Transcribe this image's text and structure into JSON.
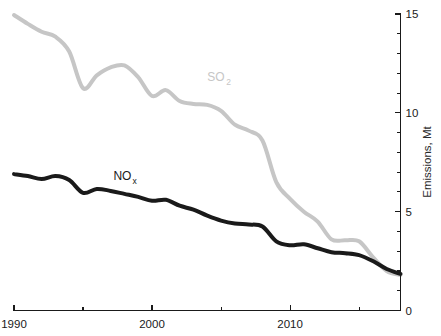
{
  "chart_data": {
    "type": "line",
    "title": "",
    "xlabel": "",
    "ylabel": "Emissions, Mt",
    "xlim": [
      1990,
      2018
    ],
    "ylim": [
      0,
      15
    ],
    "grid": false,
    "legend_position": "inline-annotation",
    "y_axis_side": "right",
    "x_ticks": [
      1990,
      1995,
      2000,
      2005,
      2010,
      2015
    ],
    "x_tick_labels": [
      "1990",
      "",
      "2000",
      "",
      "2010",
      ""
    ],
    "y_ticks": [
      0,
      1,
      2,
      3,
      4,
      5,
      6,
      7,
      8,
      9,
      10,
      11,
      12,
      13,
      14,
      15
    ],
    "y_tick_labels": [
      "0",
      "",
      "",
      "",
      "",
      "5",
      "",
      "",
      "",
      "",
      "10",
      "",
      "",
      "",
      "",
      "15"
    ],
    "x": [
      1990,
      1991,
      1992,
      1993,
      1994,
      1995,
      1996,
      1997,
      1998,
      1999,
      2000,
      2001,
      2002,
      2003,
      2004,
      2005,
      2006,
      2007,
      2008,
      2009,
      2010,
      2011,
      2012,
      2013,
      2014,
      2015,
      2016,
      2017,
      2018
    ],
    "series": [
      {
        "name": "SO2",
        "label": "SO",
        "label_sub": "2",
        "color": "#c6c6c6",
        "stroke_width": 4.0,
        "label_x": 2004.0,
        "label_y": 11.6,
        "values": [
          14.95,
          14.5,
          14.1,
          13.85,
          13.1,
          11.25,
          11.9,
          12.3,
          12.4,
          11.8,
          10.85,
          11.15,
          10.6,
          10.45,
          10.4,
          10.1,
          9.4,
          9.1,
          8.6,
          6.5,
          5.65,
          5.0,
          4.5,
          3.6,
          3.55,
          3.5,
          2.7,
          2.0,
          1.8
        ]
      },
      {
        "name": "NOx",
        "label": "NO",
        "label_sub": "x",
        "color": "#1a1a1a",
        "stroke_width": 4.0,
        "label_x": 1997.2,
        "label_y": 6.6,
        "values": [
          6.9,
          6.8,
          6.65,
          6.8,
          6.6,
          5.95,
          6.15,
          6.05,
          5.9,
          5.75,
          5.55,
          5.6,
          5.3,
          5.1,
          4.8,
          4.55,
          4.4,
          4.35,
          4.25,
          3.5,
          3.3,
          3.35,
          3.15,
          2.95,
          2.9,
          2.8,
          2.5,
          2.1,
          1.85
        ]
      }
    ]
  },
  "axis": {
    "y_title": "Emissions, Mt",
    "y_labels": {
      "zero": "0",
      "five": "5",
      "ten": "10",
      "fifteen": "15"
    },
    "x_labels": {
      "start": "1990",
      "mid": "2000",
      "end": "2010"
    }
  }
}
